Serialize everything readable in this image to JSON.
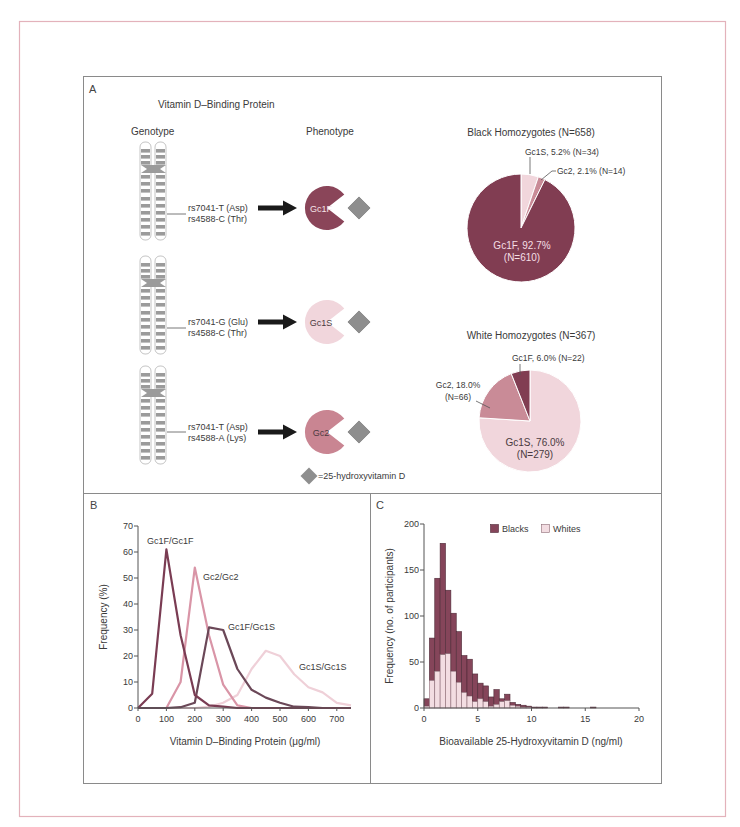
{
  "figure": {
    "colors": {
      "outer_frame": "#e3b2bb",
      "panel_border": "#8a8a8a",
      "gc1f": "#823e53",
      "gc1s": "#f1d6dc",
      "gc2": "#c98b97",
      "diamond": "#8e8e8e",
      "arrow": "#1a1a1a"
    },
    "panel_a": {
      "label": "A",
      "title": "Vitamin D–Binding Protein",
      "genotype_header": "Genotype",
      "phenotype_header": "Phenotype",
      "rows": [
        {
          "snp1": "rs7041-T (Asp)",
          "snp2": "rs4588-C (Thr)",
          "phenotype": "Gc1F",
          "shape_color": "#8a4559",
          "text_color": "#f6e2e7"
        },
        {
          "snp1": "rs7041-G (Glu)",
          "snp2": "rs4588-C (Thr)",
          "phenotype": "Gc1S",
          "shape_color": "#f1d6dc",
          "text_color": "#4a3a40"
        },
        {
          "snp1": "rs7041-T (Asp)",
          "snp2": "rs4588-A (Lys)",
          "phenotype": "Gc2",
          "shape_color": "#c98592",
          "text_color": "#4a3a40"
        }
      ],
      "legend_text": "=25-hydroxyvitamin D"
    },
    "panel_b": {
      "label": "B"
    },
    "panel_c": {
      "label": "C"
    }
  },
  "chart_data": [
    {
      "id": "black-homozygotes-pie",
      "type": "pie",
      "title": "Black Homozygotes (N=658)",
      "total_n": 658,
      "start_angle": "12 o'clock, clockwise",
      "slices": [
        {
          "label": "Gc1S",
          "percent": 5.2,
          "n": 34,
          "color": "#f1d6dc",
          "label_lines": [
            "Gc1S, 5.2% (N=34)"
          ]
        },
        {
          "label": "Gc2",
          "percent": 2.1,
          "n": 14,
          "color": "#c98b97",
          "label_lines": [
            "Gc2, 2.1% (N=14)"
          ]
        },
        {
          "label": "Gc1F",
          "percent": 92.7,
          "n": 610,
          "color": "#813d52",
          "label_lines": [
            "Gc1F, 92.7%",
            "(N=610)"
          ]
        }
      ]
    },
    {
      "id": "white-homozygotes-pie",
      "type": "pie",
      "title": "White Homozygotes (N=367)",
      "total_n": 367,
      "start_angle": "12 o'clock, clockwise",
      "slices": [
        {
          "label": "Gc1S",
          "percent": 76.0,
          "n": 279,
          "color": "#f1d6dc",
          "label_lines": [
            "Gc1S, 76.0%",
            "(N=279)"
          ]
        },
        {
          "label": "Gc2",
          "percent": 18.0,
          "n": 66,
          "color": "#c98b97",
          "label_lines": [
            "Gc2, 18.0%",
            "(N=66)"
          ]
        },
        {
          "label": "Gc1F",
          "percent": 6.0,
          "n": 22,
          "color": "#813d52",
          "label_lines": [
            "Gc1F, 6.0% (N=22)"
          ]
        }
      ]
    },
    {
      "id": "panel-b-dbp-distribution",
      "type": "line",
      "title": "",
      "xlabel": "Vitamin D–Binding Protein (μg/ml)",
      "ylabel": "Frequency (%)",
      "xlim": [
        0,
        750
      ],
      "ylim": [
        0,
        70
      ],
      "xticks": [
        0,
        100,
        200,
        300,
        400,
        500,
        600,
        700
      ],
      "yticks": [
        0,
        10,
        20,
        30,
        40,
        50,
        60,
        70
      ],
      "grid": false,
      "legend_position": "inline labels",
      "x": [
        0,
        50,
        100,
        150,
        200,
        250,
        300,
        350,
        400,
        450,
        500,
        550,
        600,
        650,
        700,
        750
      ],
      "series": [
        {
          "name": "Gc1S/Gc1S",
          "color": "#efd0d8",
          "values": [
            0,
            0,
            0,
            0,
            0,
            0.5,
            2,
            5,
            15,
            22,
            20,
            13,
            8,
            6,
            2,
            1
          ]
        },
        {
          "name": "Gc2/Gc2",
          "color": "#d995a7",
          "values": [
            0,
            0,
            0,
            10,
            54,
            28,
            9,
            1,
            0,
            0,
            0,
            0,
            0,
            0,
            0,
            0
          ]
        },
        {
          "name": "Gc1F/Gc1S",
          "color": "#6b4858",
          "values": [
            0,
            0,
            0,
            0.3,
            2,
            31,
            30,
            15,
            7,
            4,
            2,
            0.5,
            0.3,
            0,
            0,
            0
          ]
        },
        {
          "name": "Gc1F/Gc1F",
          "color": "#7a3c53",
          "values": [
            0,
            5.5,
            61,
            28,
            5,
            1,
            0.5,
            0,
            0,
            0,
            0,
            0,
            0,
            0,
            0,
            0
          ]
        }
      ],
      "annotations": [
        {
          "text": "Gc1F/Gc1F",
          "x": 147,
          "y": 544
        },
        {
          "text": "Gc2/Gc2",
          "x": 203,
          "y": 580
        },
        {
          "text": "Gc1F/Gc1S",
          "x": 228,
          "y": 630
        },
        {
          "text": "Gc1S/Gc1S",
          "x": 299,
          "y": 670
        }
      ]
    },
    {
      "id": "panel-c-bioavailable-histogram",
      "type": "bar",
      "stacked": true,
      "title": "",
      "xlabel": "Bioavailable 25-Hydroxyvitamin D (ng/ml)",
      "ylabel": "Frequency (no. of participants)",
      "xlim": [
        0,
        20
      ],
      "ylim": [
        0,
        200
      ],
      "xticks": [
        0,
        5,
        10,
        15,
        20
      ],
      "yticks": [
        0,
        50,
        100,
        150,
        200
      ],
      "grid": false,
      "legend_position": "top-right inside",
      "bin_width": 0.5,
      "bin_starts": [
        0,
        0.5,
        1,
        1.5,
        2,
        2.5,
        3,
        3.5,
        4,
        4.5,
        5,
        5.5,
        6,
        6.5,
        7,
        7.5,
        8,
        8.5,
        9,
        9.5,
        10,
        10.5,
        11,
        11.5,
        12,
        12.5,
        13,
        13.5,
        14,
        14.5,
        15,
        15.5
      ],
      "series": [
        {
          "name": "Whites",
          "color": "#f3dde2",
          "stroke": "#8c6b76",
          "values": [
            2,
            30,
            40,
            58,
            59,
            40,
            28,
            17,
            13,
            7,
            10,
            7,
            2,
            4,
            7,
            8,
            3,
            2,
            1,
            1,
            0,
            0,
            0,
            0,
            0,
            0,
            0,
            0,
            0,
            0,
            0,
            0
          ]
        },
        {
          "name": "Blacks",
          "color": "#85455a",
          "stroke": "#4e2a37",
          "values": [
            8,
            46,
            101,
            121,
            69,
            63,
            55,
            40,
            40,
            30,
            17,
            17,
            10,
            16,
            3,
            7,
            3,
            2,
            2,
            1,
            1,
            1,
            1,
            0,
            0,
            1,
            1,
            0,
            0,
            0,
            0,
            1
          ]
        }
      ],
      "legend": [
        {
          "label": "Blacks",
          "color": "#85455a"
        },
        {
          "label": "Whites",
          "color": "#f3dde2"
        }
      ]
    }
  ]
}
